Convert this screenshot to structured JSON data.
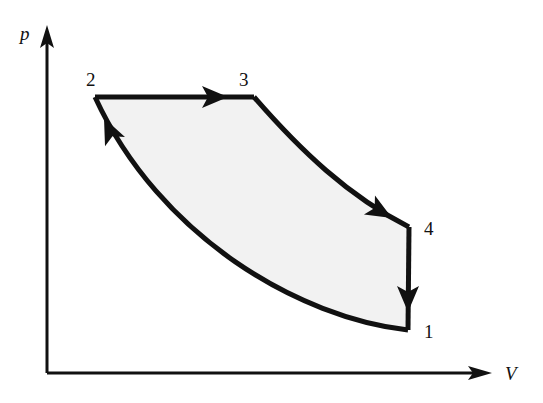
{
  "figure": {
    "background_color": "#ffffff",
    "stroke_color": "#111111",
    "fill_color": "#f2f2f2",
    "axis_stroke_width": 3,
    "cycle_stroke_width": 5
  },
  "axes": {
    "vertical": {
      "label": "p",
      "name": "pressure-axis",
      "origin": [
        47,
        373
      ],
      "tip": [
        47,
        25
      ],
      "label_position": [
        20,
        40
      ]
    },
    "horizontal": {
      "label": "V",
      "name": "volume-axis",
      "origin": [
        47,
        373
      ],
      "tip": [
        492,
        373
      ],
      "label_position": [
        505,
        380
      ]
    }
  },
  "chart_data": {
    "type": "line",
    "xlabel": "V",
    "ylabel": "p",
    "grid": false,
    "legend": null,
    "axis_ranges": {
      "x": [
        47,
        492
      ],
      "y": [
        373,
        25
      ]
    },
    "states": [
      {
        "label": "1",
        "point": [
          408,
          330
        ],
        "label_position": [
          424,
          338
        ]
      },
      {
        "label": "2",
        "point": [
          95,
          97
        ],
        "label_position": [
          86,
          86
        ]
      },
      {
        "label": "3",
        "point": [
          254,
          97
        ],
        "label_position": [
          239,
          86
        ]
      },
      {
        "label": "4",
        "point": [
          409,
          227
        ],
        "label_position": [
          424,
          235
        ]
      }
    ],
    "processes": [
      {
        "name": "process-2-to-3",
        "from": "2",
        "to": "3",
        "shape": "straight",
        "description": "isobaric expansion",
        "path": "M 95 97 L 254 97",
        "arrow_at": [
          228,
          97
        ],
        "arrow_angle": 0
      },
      {
        "name": "process-3-to-4",
        "from": "3",
        "to": "4",
        "shape": "curve",
        "description": "adiabatic expansion",
        "path": "M 254 97 C 300 150 348 196 409 227",
        "arrow_at": [
          392,
          218
        ],
        "arrow_angle": 30
      },
      {
        "name": "process-4-to-1",
        "from": "4",
        "to": "1",
        "shape": "straight",
        "description": "isochoric pressure drop",
        "path": "M 409 227 L 408 330",
        "arrow_at": [
          408,
          312
        ],
        "arrow_angle": 90
      },
      {
        "name": "process-1-to-2",
        "from": "1",
        "to": "2",
        "shape": "curve",
        "description": "adiabatic compression",
        "path": "M 408 330 C 300 318 160 238 95 97",
        "arrow_at": [
          104,
          118
        ],
        "arrow_angle": 245
      }
    ],
    "enclosed_area": {
      "name": "cycle-work-area",
      "fill": "#f2f2f2",
      "path": "M 95 97 L 254 97 C 300 150 348 196 409 227 L 408 330 C 300 318 160 238 95 97 Z"
    }
  }
}
